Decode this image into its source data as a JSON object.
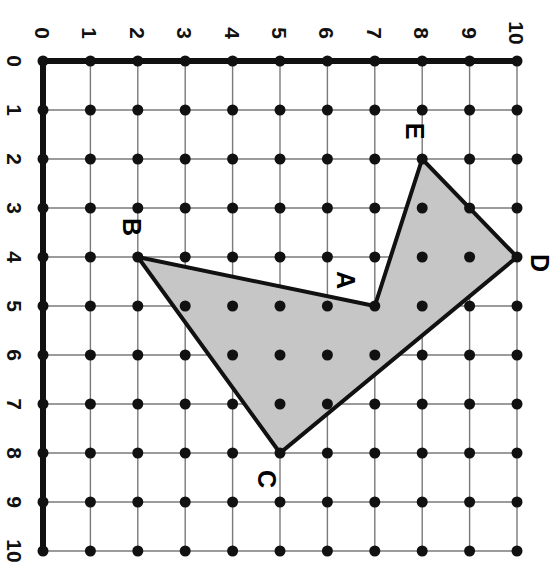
{
  "figure": {
    "orientation_note": "image rotated 90 degrees clockwise",
    "background_color": "#ffffff"
  },
  "grid": {
    "min": 0,
    "max": 10,
    "step": 1,
    "origin_px": {
      "x": 43,
      "y": 61
    },
    "spacing_px": {
      "x": 47.4,
      "y": 49.0
    },
    "lattice_dot_color": "#111111",
    "lattice_dot_radius_px": 5.5,
    "inner_line_color": "#7a7a7a",
    "inner_line_width_px": 1.4,
    "axis_line_color": "#111111",
    "axis_line_width_px": 6
  },
  "axes": {
    "top": {
      "name": "horizontal-axis",
      "ticks": [
        "0",
        "1",
        "2",
        "3",
        "4",
        "5",
        "6",
        "7",
        "8",
        "9",
        "10"
      ]
    },
    "left": {
      "name": "vertical-axis",
      "ticks": [
        "0",
        "1",
        "2",
        "3",
        "4",
        "5",
        "6",
        "7",
        "8",
        "9",
        "10"
      ]
    }
  },
  "shape": {
    "name": "polygon-ABCDE",
    "fill_color": "#c6c6c6",
    "stroke_color": "#111111",
    "stroke_width_px": 4,
    "vertices": [
      {
        "label": "A",
        "x": 7,
        "y": 5,
        "label_offset_px": {
          "x": -30,
          "y": -26
        }
      },
      {
        "label": "B",
        "x": 2,
        "y": 4,
        "label_offset_px": {
          "x": -7,
          "y": -30
        }
      },
      {
        "label": "C",
        "x": 5,
        "y": 8,
        "label_offset_px": {
          "x": -14,
          "y": 26
        }
      },
      {
        "label": "D",
        "x": 10,
        "y": 4,
        "label_offset_px": {
          "x": 22,
          "y": 6
        }
      },
      {
        "label": "E",
        "x": 8,
        "y": 2,
        "label_offset_px": {
          "x": -8,
          "y": -28
        }
      }
    ],
    "path_order": [
      "A",
      "B",
      "C",
      "D",
      "E"
    ]
  }
}
